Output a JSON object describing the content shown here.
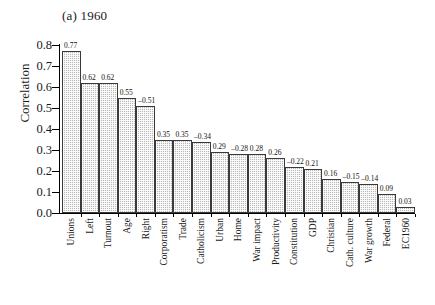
{
  "chart_data": {
    "type": "bar",
    "title": "(a) 1960",
    "xlabel": "",
    "ylabel": "Correlation",
    "ylim": [
      0.0,
      0.8
    ],
    "yticks": [
      "0.0",
      "0.1",
      "0.2",
      "0.3",
      "0.4",
      "0.5",
      "0.6",
      "0.7",
      "0.8"
    ],
    "grid": false,
    "legend": null,
    "categories": [
      "Unions",
      "Left",
      "Turnout",
      "Age",
      "Right",
      "Corporatism",
      "Trade",
      "Catholicism",
      "Urban",
      "Home",
      "War impact",
      "Productivity",
      "Constitution",
      "GDP",
      "Christian",
      "Cath. culture",
      "War growth",
      "Federal",
      "EC1960"
    ],
    "values": [
      0.77,
      0.62,
      0.62,
      0.55,
      0.51,
      0.35,
      0.35,
      0.34,
      0.29,
      0.28,
      0.28,
      0.26,
      0.22,
      0.21,
      0.16,
      0.15,
      0.14,
      0.09,
      0.03
    ],
    "value_labels": [
      "0.77",
      "0.62",
      "0.62",
      "0.55",
      "–0.51",
      "0.35",
      "0.35",
      "–0.34",
      "0.29",
      "–0.28",
      "0.28",
      "0.26",
      "–0.22",
      "0.21",
      "0.16",
      "–0.15",
      "–0.14",
      "0.09",
      "0.03"
    ],
    "signed_values": [
      0.77,
      0.62,
      0.62,
      0.55,
      -0.51,
      0.35,
      0.35,
      -0.34,
      0.29,
      -0.28,
      0.28,
      0.26,
      -0.22,
      0.21,
      0.16,
      -0.15,
      -0.14,
      0.09,
      0.03
    ],
    "note": "Bars show absolute magnitude of correlation; labels carry the sign.",
    "colors": {
      "bar_fill": "#b9b9b9",
      "bar_edge": "#3a3a3a",
      "axis": "#000000",
      "text": "#1a1a1a"
    }
  }
}
